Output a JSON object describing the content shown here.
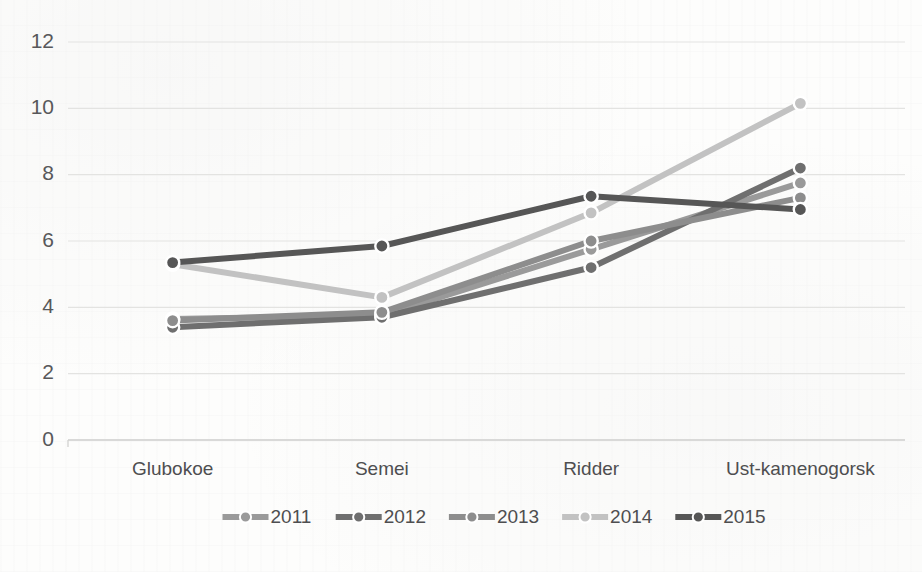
{
  "chart_data": {
    "type": "line",
    "title": "",
    "subtitle": "",
    "xlabel": "",
    "ylabel": "",
    "categories": [
      "Glubokoe",
      "Semei",
      "Ridder",
      "Ust-kamenogorsk"
    ],
    "ylim": [
      0,
      12
    ],
    "yticks": [
      0,
      2,
      4,
      6,
      8,
      10,
      12
    ],
    "ytick_labels": [
      "0",
      "2",
      "4",
      "6",
      "8",
      "10",
      "12"
    ],
    "grid": true,
    "legend_position": "bottom",
    "series": [
      {
        "name": "2011",
        "values": [
          3.65,
          3.75,
          5.75,
          7.75
        ],
        "color": "#9a9a9a"
      },
      {
        "name": "2012",
        "values": [
          3.4,
          3.7,
          5.2,
          8.2
        ],
        "color": "#6f6f6f"
      },
      {
        "name": "2013",
        "values": [
          3.6,
          3.85,
          6.0,
          7.3
        ],
        "color": "#8d8d8d"
      },
      {
        "name": "2014",
        "values": [
          5.3,
          4.3,
          6.85,
          10.15
        ],
        "color": "#c2c2c2"
      },
      {
        "name": "2015",
        "values": [
          5.35,
          5.85,
          7.35,
          6.95
        ],
        "color": "#565656"
      }
    ]
  },
  "axis": {
    "y_axis_name": "value-axis",
    "x_axis_name": "category-axis"
  },
  "legend": {
    "entries": [
      "2011",
      "2012",
      "2013",
      "2014",
      "2015"
    ]
  }
}
